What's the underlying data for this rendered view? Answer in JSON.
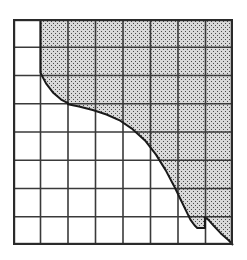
{
  "figure": {
    "kind": "shaded-region-over-grid",
    "background_color": "#ffffff"
  },
  "chart_data": {
    "type": "area",
    "title": "",
    "subtitle": "",
    "xlabel": "",
    "ylabel": "",
    "xlim": [
      0,
      8
    ],
    "ylim": [
      0,
      8
    ],
    "grid": true,
    "grid_columns": 8,
    "grid_rows": 8,
    "legend": null,
    "annotations": [],
    "tick_labels_x": [],
    "tick_labels_y": [],
    "series": [
      {
        "name": "boundary-curve",
        "description": "Decreasing curve from upper-left to lower-right with two step discontinuities",
        "x": [
          1.0,
          1.0,
          1.05,
          1.2,
          1.45,
          1.75,
          2.0,
          2.0,
          2.4,
          2.9,
          3.4,
          3.9,
          4.35,
          4.8,
          5.2,
          5.55,
          5.85,
          6.1,
          6.3,
          6.45,
          6.6,
          6.7,
          6.98,
          6.98,
          7.1,
          7.3,
          7.55,
          7.85,
          8.0
        ],
        "y": [
          8.0,
          6.1,
          6.0,
          5.72,
          5.4,
          5.15,
          5.02,
          4.98,
          4.9,
          4.78,
          4.62,
          4.4,
          4.1,
          3.7,
          3.2,
          2.65,
          2.1,
          1.6,
          1.2,
          0.9,
          0.7,
          0.6,
          0.6,
          0.98,
          0.9,
          0.68,
          0.42,
          0.16,
          0.0
        ]
      }
    ],
    "shaded_region": {
      "name": "stippled-area",
      "side": "above-right",
      "fill_color": "#d9d9d9",
      "pattern": "stipple-dots",
      "pattern_dot_color": "#4a4a4a"
    },
    "styling": {
      "curve_color": "#1a1a1a",
      "curve_width_px": 2.0,
      "grid_line_color": "#3a3a3a",
      "grid_line_width_px": 1.6,
      "border_color": "#2a2a2a",
      "border_width_px": 2.2,
      "plot_left_px": 13,
      "plot_top_px": 19,
      "plot_width_px": 220,
      "plot_height_px": 226
    }
  }
}
